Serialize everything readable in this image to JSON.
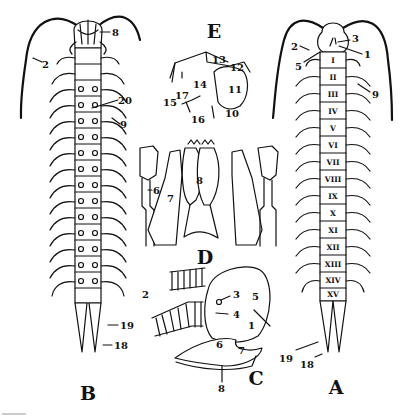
{
  "figure": {
    "panels": [
      {
        "id": "A",
        "label": "A",
        "view": "dorsal view of centipede body"
      },
      {
        "id": "B",
        "label": "B",
        "view": "ventral view of centipede body"
      },
      {
        "id": "C",
        "label": "C",
        "view": "lateral view of head"
      },
      {
        "id": "D",
        "label": "D",
        "view": "mouthparts"
      },
      {
        "id": "E",
        "label": "E",
        "view": "leg"
      }
    ],
    "panel_A": {
      "segments": [
        "I",
        "II",
        "III",
        "IV",
        "V",
        "VI",
        "VII",
        "VIII",
        "IX",
        "X",
        "XI",
        "XII",
        "XIII",
        "XIV",
        "XV"
      ],
      "callouts": [
        "1",
        "2",
        "3",
        "5",
        "9",
        "18",
        "19"
      ]
    },
    "panel_B": {
      "callouts": [
        "2",
        "8",
        "9",
        "18",
        "19",
        "20"
      ]
    },
    "panel_C": {
      "callouts": [
        "1",
        "2",
        "3",
        "4",
        "5",
        "6",
        "7",
        "8"
      ]
    },
    "panel_D": {
      "callouts": [
        "6",
        "7",
        "8"
      ]
    },
    "panel_E": {
      "callouts": [
        "10",
        "11",
        "12",
        "13",
        "14",
        "15",
        "16",
        "17"
      ]
    }
  },
  "colors": {
    "ink": "#111111",
    "paper": "#ffffff"
  }
}
